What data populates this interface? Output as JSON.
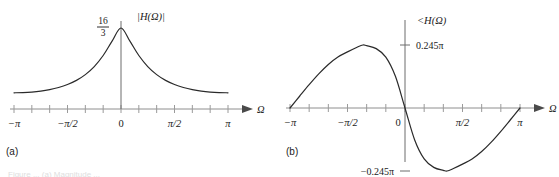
{
  "figure": {
    "caption_fragment": "Figure ... (a) Magnitude ...",
    "panels": [
      {
        "id": "a",
        "caption": "(a)"
      },
      {
        "id": "b",
        "caption": "(b)"
      }
    ]
  },
  "axis_labels": {
    "omega": "Ω",
    "minus_pi": "−π",
    "minus_half_pi": "−π/2",
    "zero": "0",
    "half_pi": "π/2",
    "pi": "π"
  },
  "panel_a": {
    "curve_label": "|H(Ω)|",
    "peak_label_numerator": "16",
    "peak_label_denominator": "3"
  },
  "panel_b": {
    "curve_label": "<H(Ω)",
    "positive_label": "0.245π",
    "negative_label": "−0.245π"
  },
  "colors": {
    "curve": "#2a2a2a",
    "axis": "#8e8e8e",
    "tick": "#9a9a9a",
    "text": "#1a1a1a",
    "background": "#ffffff"
  },
  "chart_data": [
    {
      "type": "line",
      "id": "magnitude-response",
      "title": "|H(Ω)| magnitude response",
      "xlabel": "Ω",
      "ylabel": "|H(Ω)|",
      "xlim": [
        -3.14159,
        3.14159
      ],
      "ylim": [
        0,
        5.3333
      ],
      "grid": false,
      "legend": null,
      "xtick_values": [
        -3.14159,
        -1.5708,
        0,
        1.5708,
        3.14159
      ],
      "xtick_labels": [
        "−π",
        "−π/2",
        "0",
        "π/2",
        "π"
      ],
      "minor_tick_count": 12,
      "annotations": [
        {
          "text": "16/3",
          "x": 0,
          "y": 5.3333,
          "note": "peak value at Ω = 0"
        }
      ],
      "x": [
        -3.14159,
        -2.87979,
        -2.61799,
        -2.35619,
        -2.0944,
        -1.8326,
        -1.5708,
        -1.309,
        -1.0472,
        -0.7854,
        -0.5236,
        -0.2618,
        0,
        0.2618,
        0.5236,
        0.7854,
        1.0472,
        1.309,
        1.5708,
        1.8326,
        2.0944,
        2.35619,
        2.61799,
        2.87979,
        3.14159
      ],
      "values": [
        1.0667,
        1.0784,
        1.1146,
        1.1784,
        1.2755,
        1.4154,
        1.6116,
        1.8847,
        2.2651,
        2.7953,
        3.5227,
        4.4659,
        5.3333,
        4.4659,
        3.5227,
        2.7953,
        2.2651,
        1.8847,
        1.6116,
        1.4154,
        1.2755,
        1.1784,
        1.1146,
        1.0784,
        1.0667
      ],
      "value_at_pi": 1.0667,
      "value_at_zero": 5.3333
    },
    {
      "type": "line",
      "id": "phase-response",
      "title": "∠H(Ω) phase response",
      "xlabel": "Ω",
      "ylabel": "<H(Ω)",
      "xlim": [
        -3.14159,
        3.14159
      ],
      "ylim": [
        -0.7697,
        0.7697
      ],
      "grid": false,
      "legend": null,
      "xtick_values": [
        -3.14159,
        -1.5708,
        0,
        1.5708,
        3.14159
      ],
      "xtick_labels": [
        "−π",
        "−π/2",
        "0",
        "π/2",
        "π"
      ],
      "ytick_values": [
        -0.7697,
        0.7697
      ],
      "ytick_labels": [
        "−0.245π",
        "0.245π"
      ],
      "minor_tick_count": 12,
      "annotations": [
        {
          "text": "0.245π",
          "x": -1.15,
          "y": 0.7697,
          "note": "maximum phase"
        },
        {
          "text": "−0.245π",
          "x": 1.15,
          "y": -0.7697,
          "note": "minimum phase"
        }
      ],
      "x": [
        -3.14159,
        -2.87979,
        -2.61799,
        -2.35619,
        -2.0944,
        -1.8326,
        -1.5708,
        -1.309,
        -1.15,
        -1.0472,
        -0.7854,
        -0.5236,
        -0.2618,
        0,
        0.2618,
        0.5236,
        0.7854,
        1.0472,
        1.15,
        1.309,
        1.5708,
        1.8326,
        2.0944,
        2.35619,
        2.61799,
        2.87979,
        3.14159
      ],
      "values": [
        0.0,
        0.1435,
        0.2846,
        0.4168,
        0.5322,
        0.6232,
        0.6855,
        0.7423,
        0.7697,
        0.7618,
        0.7254,
        0.6216,
        0.3869,
        0.0,
        -0.3869,
        -0.6216,
        -0.7254,
        -0.7618,
        -0.7697,
        -0.7423,
        -0.6855,
        -0.6232,
        -0.5322,
        -0.4168,
        -0.2846,
        -0.1435,
        0.0
      ],
      "peak_value": 0.7697,
      "peak_x": -1.15,
      "trough_value": -0.7697,
      "trough_x": 1.15
    }
  ]
}
